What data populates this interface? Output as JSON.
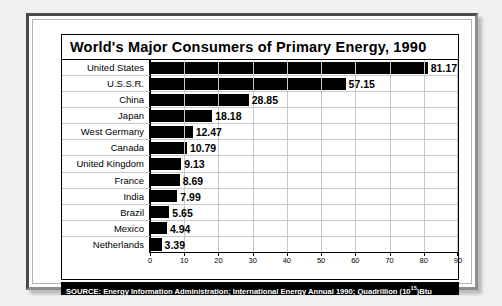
{
  "chart_data": {
    "type": "bar",
    "orientation": "horizontal",
    "title": "World's Major Consumers of Primary Energy, 1990",
    "xlabel": "",
    "ylabel": "",
    "xlim": [
      0,
      90
    ],
    "xticks": [
      0,
      10,
      20,
      30,
      40,
      50,
      60,
      70,
      80,
      90
    ],
    "grid": true,
    "legend": "none",
    "bar_color": "#000000",
    "categories": [
      "United States",
      "U.S.S.R.",
      "China",
      "Japan",
      "West Germany",
      "Canada",
      "United Kingdom",
      "France",
      "India",
      "Brazil",
      "Mexico",
      "Netherlands"
    ],
    "values": [
      81.17,
      57.15,
      28.85,
      18.18,
      12.47,
      10.79,
      9.13,
      8.69,
      7.99,
      5.65,
      4.94,
      3.39
    ],
    "value_labels": [
      "81.17",
      "57.15",
      "28.85",
      "18.18",
      "12.47",
      "10.79",
      "9.13",
      "8.69",
      "7.99",
      "5.65",
      "4.94",
      "3.39"
    ],
    "units": "Quadrillion (10^15) Btu"
  },
  "source": {
    "prefix": "SOURCE: Energy Information Administration; International Energy Annual 1990; Quadrillion (10",
    "exponent": "15",
    "suffix": ")Btu"
  }
}
